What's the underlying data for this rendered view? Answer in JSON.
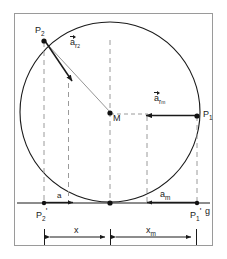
{
  "figure": {
    "background_color": "#ffffff",
    "frame_color": "#9a9a9a",
    "stroke_color": "#1a1a1a",
    "dashed_color": "#9a9a9a",
    "labels": {
      "point_p2": "P",
      "point_p2_sub": "2",
      "point_p1": "P",
      "point_p1_sub": "1",
      "point_p2_prime": "P",
      "point_p2_prime_sub": "2",
      "point_p2_prime_mark": "'",
      "point_p1_prime": "P",
      "point_p1_prime_sub": "1",
      "point_p1_prime_mark": "'",
      "center": "M",
      "baseline": "g",
      "vector_r2": "a",
      "vector_r2_sub": "r",
      "vector_r2_sub2": "2",
      "vector_rm": "a",
      "vector_rm_sub": "r",
      "vector_rm_sub2": "m",
      "arc_a": "a",
      "arc_am": "a",
      "arc_am_sub": "m",
      "dim_x": "x",
      "dim_xm": "x",
      "dim_xm_sub": "m"
    },
    "geometry": {
      "circle_center_x": 110,
      "circle_center_y": 112,
      "circle_radius": 90,
      "baseline_y": 203,
      "tangent_point_x": 110,
      "p2_x": 44,
      "p2_y": 40,
      "p1_x": 197,
      "p1_y": 116,
      "p2_prime_x": 44,
      "p1_prime_x": 197,
      "dim_row_y": 237
    }
  }
}
